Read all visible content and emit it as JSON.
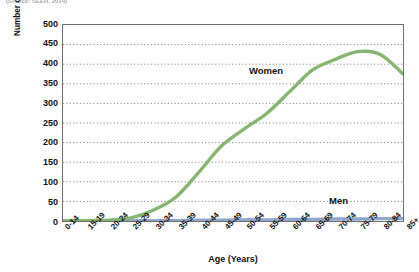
{
  "caption": {
    "text": "(Source: SEER, 2014)"
  },
  "chart_data": {
    "type": "line",
    "title": "",
    "xlabel": "Age (Years)",
    "ylabel": "Number of Breast Cancer Cases per 100,000 Women/Men Each Year",
    "categories": [
      "0-14",
      "15-19",
      "20-24",
      "25-29",
      "30-34",
      "35-39",
      "40-44",
      "45-49",
      "50-54",
      "55-59",
      "60-64",
      "65-69",
      "70-74",
      "75-79",
      "80-84",
      "85+"
    ],
    "ylim": [
      0,
      500
    ],
    "yticks": [
      500,
      450,
      400,
      350,
      300,
      250,
      200,
      150,
      100,
      50,
      0
    ],
    "grid": "horizontal-dotted",
    "legend_position": "inline-annotation",
    "series": [
      {
        "name": "Women",
        "color": "#85b56e",
        "label_annotation": "Women",
        "values": [
          0,
          1,
          2,
          8,
          28,
          62,
          125,
          192,
          235,
          275,
          330,
          385,
          412,
          432,
          425,
          375
        ]
      },
      {
        "name": "Men",
        "color": "#8fa7cc",
        "label_annotation": "Men",
        "values": [
          0,
          0,
          0,
          0,
          1,
          1,
          2,
          2,
          3,
          3,
          4,
          4,
          5,
          5,
          6,
          6
        ]
      }
    ]
  },
  "colors": {
    "women_line": "#85b56e",
    "men_line": "#8fa7cc",
    "grid": "#555555",
    "frame": "#6f6f6f",
    "text": "#111111"
  }
}
